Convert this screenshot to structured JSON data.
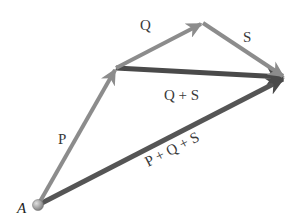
{
  "diagram": {
    "origin_label": "A",
    "vectors": [
      {
        "id": "P",
        "label": "P",
        "from": [
          38,
          205
        ],
        "to": [
          116,
          68
        ],
        "color": "#8c8c8c",
        "width": 4
      },
      {
        "id": "Q",
        "label": "Q",
        "from": [
          116,
          68
        ],
        "to": [
          203,
          23
        ],
        "color": "#8c8c8c",
        "width": 4
      },
      {
        "id": "S",
        "label": "S",
        "from": [
          203,
          23
        ],
        "to": [
          285,
          78
        ],
        "color": "#8c8c8c",
        "width": 4
      },
      {
        "id": "QS",
        "label": "Q + S",
        "from": [
          116,
          68
        ],
        "to": [
          285,
          78
        ],
        "color": "#4a4a4a",
        "width": 5
      },
      {
        "id": "PQS",
        "label": "P + Q + S",
        "from": [
          38,
          205
        ],
        "to": [
          285,
          78
        ],
        "color": "#555555",
        "width": 5
      }
    ],
    "labels": {
      "P": "P",
      "Q": "Q",
      "S": "S",
      "QS": "Q + S",
      "PQS": "P + Q + S",
      "A": "A"
    }
  }
}
